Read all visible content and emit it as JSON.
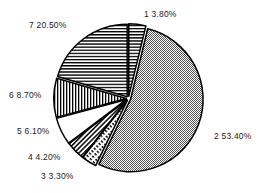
{
  "chart_data": {
    "type": "pie",
    "title": "",
    "subtitle": "",
    "xlabel": "",
    "ylabel": "",
    "grid": false,
    "legend_position": "none",
    "labels_position": "outside-callout",
    "start_angle_deg": 0,
    "direction": "clockwise",
    "exploded": true,
    "categories": [
      "1",
      "2",
      "3",
      "4",
      "5",
      "6",
      "7"
    ],
    "values": [
      3.8,
      53.4,
      3.3,
      4.2,
      6.1,
      8.7,
      20.5
    ],
    "value_unit": "%",
    "slices": [
      {
        "id": "1",
        "label": "1  3.80%",
        "category": "1",
        "value": 3.8,
        "value_text": "3.80%",
        "pattern": "horizontal-lines",
        "fill": "#ffffff",
        "stroke": "#000000"
      },
      {
        "id": "2",
        "label": "2  53.40%",
        "category": "2",
        "value": 53.4,
        "value_text": "53.40%",
        "pattern": "checker-stipple",
        "fill": "#b4b4b4",
        "stroke": "#000000"
      },
      {
        "id": "3",
        "label": "3  3.30%",
        "category": "3",
        "value": 3.3,
        "value_text": "3.30%",
        "pattern": "dashed-lines",
        "fill": "#ffffff",
        "stroke": "#000000"
      },
      {
        "id": "4",
        "label": "4  4.20%",
        "category": "4",
        "value": 4.2,
        "value_text": "4.20%",
        "pattern": "diagonal-lines",
        "fill": "#ffffff",
        "stroke": "#000000"
      },
      {
        "id": "5",
        "label": "5  6.10%",
        "category": "5",
        "value": 6.1,
        "value_text": "6.10%",
        "pattern": "solid-white",
        "fill": "#ffffff",
        "stroke": "#000000"
      },
      {
        "id": "6",
        "label": "6  8.70%",
        "category": "6",
        "value": 8.7,
        "value_text": "8.70%",
        "pattern": "vertical-lines",
        "fill": "#ffffff",
        "stroke": "#000000"
      },
      {
        "id": "7",
        "label": "7  20.50%",
        "category": "7",
        "value": 20.5,
        "value_text": "20.50%",
        "pattern": "horizontal-lines",
        "fill": "#ffffff",
        "stroke": "#000000"
      }
    ],
    "colors": {
      "background": "#ffffff",
      "outline": "#000000",
      "text": "#1a1a1a",
      "stipple_gray": "#b4b4b4"
    }
  }
}
